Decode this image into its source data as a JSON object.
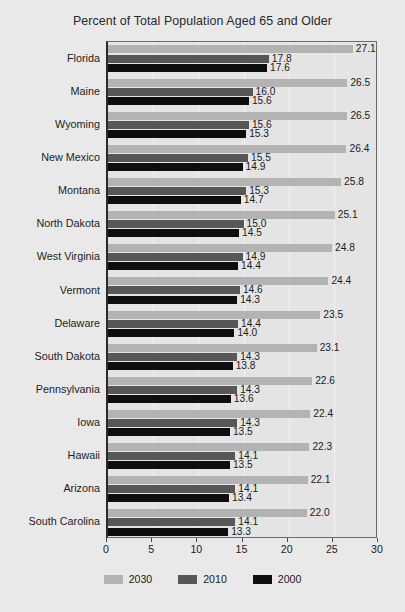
{
  "chart_data": {
    "type": "bar",
    "orientation": "horizontal",
    "title": "Percent of Total Population Aged 65 and Older",
    "xlabel": "",
    "ylabel": "",
    "xlim": [
      0,
      30
    ],
    "xticks": [
      0,
      5,
      10,
      15,
      20,
      25,
      30
    ],
    "grid": true,
    "legend_position": "bottom",
    "categories": [
      "Florida",
      "Maine",
      "Wyoming",
      "New Mexico",
      "Montana",
      "North Dakota",
      "West Virginia",
      "Vermont",
      "Delaware",
      "South Dakota",
      "Pennsylvania",
      "Iowa",
      "Hawaii",
      "Arizona",
      "South Carolina"
    ],
    "series": [
      {
        "name": "2030",
        "color": "#b3b3b3",
        "values": [
          27.1,
          26.5,
          26.5,
          26.4,
          25.8,
          25.1,
          24.8,
          24.4,
          23.5,
          23.1,
          22.6,
          22.4,
          22.3,
          22.1,
          22.0
        ]
      },
      {
        "name": "2010",
        "color": "#575757",
        "values": [
          17.8,
          16.0,
          15.6,
          15.5,
          15.3,
          15.0,
          14.9,
          14.6,
          14.4,
          14.3,
          14.3,
          14.3,
          14.1,
          14.1,
          14.1
        ]
      },
      {
        "name": "2000",
        "color": "#0e0e0e",
        "values": [
          17.6,
          15.6,
          15.3,
          14.9,
          14.7,
          14.5,
          14.4,
          14.3,
          14.0,
          13.8,
          13.6,
          13.5,
          13.5,
          13.4,
          13.3
        ]
      }
    ]
  }
}
